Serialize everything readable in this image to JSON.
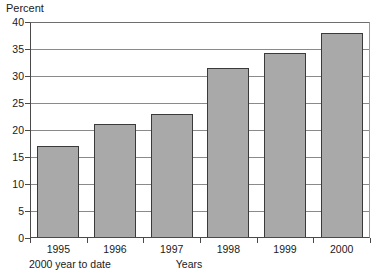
{
  "chart_data": {
    "type": "bar",
    "title": "",
    "xlabel": "Years",
    "ylabel": "Percent",
    "categories": [
      "1995",
      "1996",
      "1997",
      "1998",
      "1999",
      "2000"
    ],
    "values": [
      17.0,
      21.2,
      23.0,
      31.5,
      34.3,
      38.0
    ],
    "ylim": [
      0,
      40
    ],
    "yticks": [
      0,
      5,
      10,
      15,
      20,
      25,
      30,
      35,
      40
    ],
    "ytick_labels": [
      "0",
      "5",
      "10",
      "15",
      "20",
      "25",
      "30",
      "35",
      "40"
    ],
    "grid": true,
    "legend": false,
    "annotations": [
      "2000 year to date"
    ],
    "bar_fill_color": "#a9a9a9",
    "bar_edge_color": "#3a3a3a",
    "grid_color": "#8a8a8a",
    "background_color": "#ffffff"
  },
  "footnote": "2000 year to date"
}
